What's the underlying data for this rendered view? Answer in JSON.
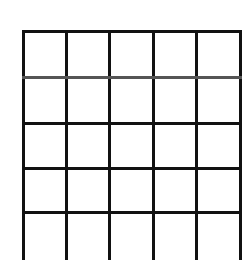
{
  "grid": {
    "columns": 5,
    "rows": 5,
    "line_color": "#111111",
    "background": "#ffffff",
    "cells": [
      [
        "",
        "",
        "",
        "",
        ""
      ],
      [
        "",
        "",
        "",
        "",
        ""
      ],
      [
        "",
        "",
        "",
        "",
        ""
      ],
      [
        "",
        "",
        "",
        "",
        ""
      ],
      [
        "",
        "",
        "",
        "",
        ""
      ]
    ]
  }
}
